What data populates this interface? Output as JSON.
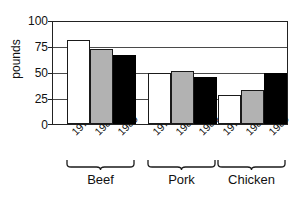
{
  "chart_data": {
    "type": "bar",
    "title": "",
    "xlabel": "",
    "ylabel": "pounds",
    "ylim": [
      0,
      100
    ],
    "yticks": [
      0,
      25,
      50,
      75,
      100
    ],
    "grid": true,
    "legend": "none",
    "categories": [
      "Beef",
      "Pork",
      "Chicken"
    ],
    "series": [
      {
        "name": "1970",
        "color": "#ffffff",
        "values": [
          81,
          49,
          28
        ]
      },
      {
        "name": "1980",
        "color": "#b2b2b2",
        "values": [
          72,
          51,
          33
        ]
      },
      {
        "name": "1989",
        "color": "#000000",
        "values": [
          66,
          45.5,
          49.5
        ]
      }
    ]
  },
  "axis": {
    "y_title": "pounds",
    "tick_100": "100",
    "tick_75": "75",
    "tick_50": "50",
    "tick_25": "25",
    "tick_0": "0"
  },
  "groups": [
    {
      "label": "Beef",
      "years": [
        "1970",
        "1980",
        "1989"
      ]
    },
    {
      "label": "Pork",
      "years": [
        "1970",
        "1980",
        "1989"
      ]
    },
    {
      "label": "Chicken",
      "years": [
        "1970",
        "1980",
        "1989"
      ]
    }
  ]
}
